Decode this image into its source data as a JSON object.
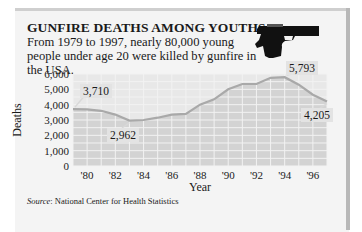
{
  "chart_data": {
    "type": "area",
    "title": "GUNFIRE DEATHS AMONG YOUTHS",
    "subtitle": "From 1979 to 1997, nearly 80,000 young people under age 20 were killed by gunfire in the USA.",
    "xlabel": "Year",
    "ylabel": "Deaths",
    "x": [
      1979,
      1980,
      1981,
      1982,
      1983,
      1984,
      1985,
      1986,
      1987,
      1988,
      1989,
      1990,
      1991,
      1992,
      1993,
      1994,
      1995,
      1996,
      1997
    ],
    "values": [
      3710,
      3700,
      3600,
      3350,
      2962,
      3000,
      3150,
      3350,
      3400,
      4000,
      4350,
      5000,
      5350,
      5350,
      5750,
      5793,
      5300,
      4650,
      4205
    ],
    "ylim": [
      0,
      6000
    ],
    "yticks": [
      "6,000",
      "5,000",
      "4,000",
      "3,000",
      "2,000",
      "1,000",
      "0"
    ],
    "xticks": [
      "'80",
      "'82",
      "'84",
      "'86",
      "'88",
      "'90",
      "'92",
      "'94",
      "'96"
    ],
    "annotations": [
      {
        "year": 1979,
        "value": 3710,
        "text": "3,710"
      },
      {
        "year": 1983,
        "value": 2962,
        "text": "2,962"
      },
      {
        "year": 1994,
        "value": 5793,
        "text": "5,793"
      },
      {
        "year": 1997,
        "value": 4205,
        "text": "4,205"
      }
    ],
    "grid": true,
    "source_label": "Source",
    "source": ": National Center for Health Statistics"
  },
  "colors": {
    "area_fill": "#d3d3d3",
    "grid": "#ececec",
    "line": "#a9a9a9",
    "card_bg": "#f4f4f4"
  },
  "icons": {
    "decoration": "pistol-icon"
  }
}
